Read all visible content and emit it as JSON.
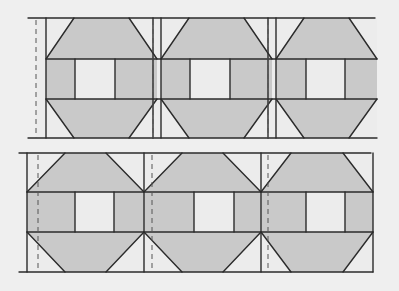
{
  "diagram": {
    "colors": {
      "background": "#efefef",
      "light_patch": "#ececec",
      "shaded_patch": "#c9c9c9",
      "line": "#2b2b2b",
      "dash": "#555555"
    },
    "rows": [
      {
        "name": "top-row",
        "top": 18,
        "bottom": 138,
        "band_top": 59,
        "band_bottom": 99,
        "left_edge": 46,
        "left_dash": 36,
        "right_edge": 377,
        "blocks": [
          {
            "x0": 46,
            "x1": 157,
            "sq0": 75,
            "sq1": 115,
            "cut": 28
          },
          {
            "x0": 161,
            "x1": 272,
            "sq0": 190,
            "sq1": 230,
            "cut": 28
          },
          {
            "x0": 276,
            "x1": 377,
            "sq0": 306,
            "sq1": 345,
            "cut": 28
          }
        ],
        "seams": [
          {
            "dash": 153,
            "solid0": 153,
            "solid1": 161
          },
          {
            "dash": 268,
            "solid0": 268,
            "solid1": 276
          }
        ]
      },
      {
        "name": "bottom-row",
        "top": 153,
        "bottom": 272,
        "band_top": 192,
        "band_bottom": 232,
        "left_edge": 27,
        "left_dash": 38,
        "right_edge": 373,
        "blocks": [
          {
            "x0": 27,
            "x1": 144,
            "sq0": 75,
            "sq1": 114,
            "cut": 38
          },
          {
            "x0": 144,
            "x1": 261,
            "sq0": 194,
            "sq1": 234,
            "cut": 38
          },
          {
            "x0": 261,
            "x1": 373,
            "sq0": 306,
            "sq1": 345,
            "cut": 30
          }
        ],
        "seams": [
          {
            "dash": 152,
            "solid0": 144,
            "solid1": 144
          },
          {
            "dash": 268,
            "solid0": 261,
            "solid1": 261
          }
        ]
      }
    ]
  }
}
